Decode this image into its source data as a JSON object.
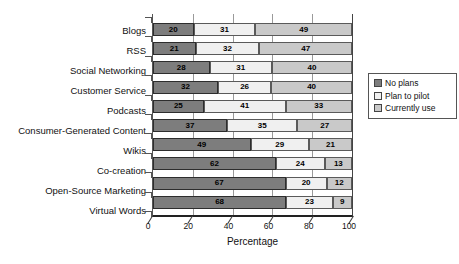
{
  "chart_data": {
    "type": "bar",
    "orientation": "horizontal",
    "stacked": true,
    "title": "",
    "xlabel": "Percentage",
    "ylabel": "",
    "xlim": [
      0,
      100
    ],
    "xticks": [
      0,
      20,
      40,
      60,
      80,
      100
    ],
    "grid": true,
    "legend_position": "right",
    "categories": [
      "Blogs",
      "RSS",
      "Social Networking",
      "Customer Service",
      "Podcasts",
      "Consumer-Generated Content",
      "Wikis",
      "Co-creation",
      "Open-Source Marketing",
      "Virtual Words"
    ],
    "series": [
      {
        "name": "No plans",
        "color": "#7d7d7d",
        "values": [
          20,
          21,
          28,
          32,
          25,
          37,
          49,
          62,
          67,
          68
        ]
      },
      {
        "name": "Plan to pilot",
        "color": "#f0f0f0",
        "values": [
          31,
          32,
          31,
          26,
          41,
          35,
          29,
          24,
          20,
          23
        ]
      },
      {
        "name": "Currently use",
        "color": "#c9c9c9",
        "values": [
          49,
          47,
          40,
          40,
          33,
          27,
          21,
          13,
          12,
          9
        ]
      }
    ]
  },
  "colors": {
    "no_plans": "#7d7d7d",
    "plan_to_pilot": "#f0f0f0",
    "currently_use": "#c9c9c9",
    "gridline": "#9a9a9a",
    "axis": "#222222",
    "text": "#111111"
  }
}
